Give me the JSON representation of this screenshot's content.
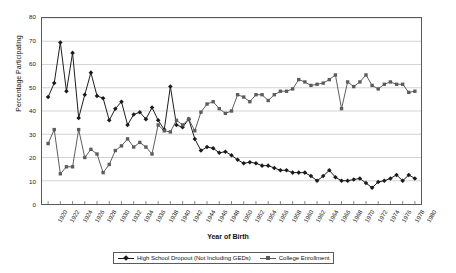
{
  "chart_data": {
    "type": "line",
    "title": "",
    "xlabel": "Year of Birth",
    "ylabel": "Percentage Participating",
    "xlim": [
      1919,
      1981
    ],
    "ylim": [
      0,
      80
    ],
    "ytick_step": 10,
    "xtick_step": 2,
    "grid": true,
    "legend_position": "bottom",
    "yticks": [
      0,
      10,
      20,
      30,
      40,
      50,
      60,
      70,
      80
    ],
    "xticks": [
      1920,
      1922,
      1924,
      1926,
      1928,
      1930,
      1932,
      1934,
      1936,
      1938,
      1940,
      1942,
      1944,
      1946,
      1948,
      1950,
      1952,
      1954,
      1956,
      1958,
      1960,
      1962,
      1964,
      1966,
      1968,
      1970,
      1972,
      1974,
      1976,
      1978,
      1980
    ],
    "x": [
      1920,
      1921,
      1922,
      1923,
      1924,
      1925,
      1926,
      1927,
      1928,
      1929,
      1930,
      1931,
      1932,
      1933,
      1934,
      1935,
      1936,
      1937,
      1938,
      1939,
      1940,
      1941,
      1942,
      1943,
      1944,
      1945,
      1946,
      1947,
      1948,
      1949,
      1950,
      1951,
      1952,
      1953,
      1954,
      1955,
      1956,
      1957,
      1958,
      1959,
      1960,
      1961,
      1962,
      1963,
      1964,
      1965,
      1966,
      1967,
      1968,
      1969,
      1970,
      1971,
      1972,
      1973,
      1974,
      1975,
      1976,
      1977,
      1978,
      1979,
      1980
    ],
    "series": [
      {
        "name": "High School Dropout (Not Including GEDs)",
        "marker": "diamond",
        "color": "#1a1a1a",
        "values": [
          46,
          52,
          69.5,
          48.5,
          65,
          37,
          47,
          56.5,
          46.5,
          45.5,
          36,
          41,
          44,
          34,
          38.5,
          39.5,
          36.5,
          41.5,
          36,
          32,
          50.5,
          34,
          33,
          36.5,
          28,
          23,
          24.5,
          24,
          22,
          22.5,
          21,
          19,
          17.5,
          18,
          17.5,
          16.5,
          16.5,
          15.5,
          14.5,
          14.5,
          13.5,
          13.5,
          13.5,
          12,
          10,
          12,
          14.5,
          11.5,
          10,
          10,
          10.5,
          11,
          9,
          7,
          9.5,
          10,
          11,
          12.5,
          10,
          12.5,
          11
        ]
      },
      {
        "name": "College Enrollment",
        "marker": "square",
        "color": "#5c5c5c",
        "values": [
          26,
          32,
          13,
          16,
          16,
          32,
          20,
          23.5,
          21.5,
          13.5,
          17,
          23,
          25,
          28,
          24.5,
          26.5,
          24.5,
          21.5,
          34,
          31.5,
          31,
          36,
          34,
          36.5,
          31.5,
          39.5,
          43,
          44,
          41,
          39,
          40,
          47,
          46,
          44,
          47,
          47,
          44.5,
          47,
          48.5,
          48.5,
          49.5,
          53.5,
          52.5,
          51,
          51.5,
          52,
          53.5,
          55.5,
          41,
          52.5,
          50.5,
          52.5,
          55.5,
          51,
          49.5,
          51.5,
          52.5,
          51.5,
          51.5,
          48,
          48.5
        ]
      }
    ]
  }
}
